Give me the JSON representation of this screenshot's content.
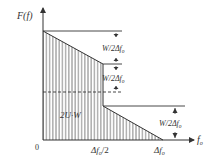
{
  "diagram": {
    "y_axis_label": "F(f)",
    "x_axis_label": "f",
    "x_axis_label_sub": "o",
    "origin_label": "0",
    "x_tick_half": "Δf",
    "x_tick_half_sub": "o",
    "x_tick_half_suffix": "/2",
    "x_tick_full": "Δf",
    "x_tick_full_sub": "o",
    "area_label": "2U·W",
    "dim_labels": [
      {
        "main": "W/2Δf",
        "sub": "o"
      },
      {
        "main": "W/2Δf",
        "sub": "o"
      },
      {
        "main": "W/2Δf",
        "sub": "o"
      }
    ],
    "colors": {
      "line": "#333333",
      "hatch": "#555555",
      "background": "#ffffff"
    }
  }
}
